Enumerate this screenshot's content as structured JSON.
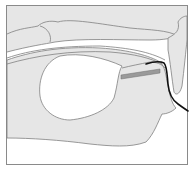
{
  "diagram": {
    "type": "anatomical-cross-section",
    "labels": [],
    "colors": {
      "background": "#ffffff",
      "frame": "#8a8a8a",
      "tissue_fill": "#e6e6e6",
      "tissue_outline": "#808080",
      "cavity_fill": "#ffffff",
      "tube": "#111111",
      "tube_insert": "#9a9a9a"
    },
    "elements": [
      {
        "name": "upper-tissue-fold"
      },
      {
        "name": "upper-lobe"
      },
      {
        "name": "right-lobe"
      },
      {
        "name": "lower-tissue-body"
      },
      {
        "name": "cavity"
      },
      {
        "name": "inserted-tube"
      },
      {
        "name": "tube-insert-segment"
      }
    ]
  }
}
